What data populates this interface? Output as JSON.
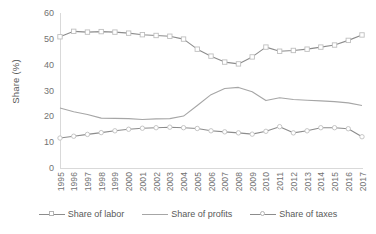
{
  "chart_data": {
    "type": "line",
    "title": "",
    "xlabel": "",
    "ylabel": "Share (%)",
    "ylim": [
      0,
      60
    ],
    "yticks": [
      0,
      10,
      20,
      30,
      40,
      50,
      60
    ],
    "grid": false,
    "legend_position": "bottom",
    "categories": [
      "1995",
      "1996",
      "1997",
      "1998",
      "1999",
      "2000",
      "2001",
      "2002",
      "2003",
      "2004",
      "2005",
      "2006",
      "2007",
      "2008",
      "2009",
      "2010",
      "2011",
      "2012",
      "2013",
      "2014",
      "2015",
      "2016",
      "2017"
    ],
    "series": [
      {
        "name": "Share of labor",
        "marker": "square",
        "color": "#8c8c8c",
        "values": [
          50.8,
          52.9,
          52.6,
          52.8,
          52.6,
          52.2,
          51.6,
          51.3,
          51.0,
          49.9,
          46.0,
          43.3,
          41.0,
          40.3,
          43.0,
          46.8,
          45.2,
          45.5,
          46.0,
          46.8,
          47.6,
          49.4,
          51.5
        ]
      },
      {
        "name": "Share of profits",
        "marker": "none",
        "color": "#a6a6a6",
        "values": [
          23.2,
          21.8,
          20.7,
          19.3,
          19.2,
          19.1,
          18.8,
          19.0,
          19.1,
          20.1,
          24.2,
          28.4,
          30.8,
          31.2,
          29.5,
          26.1,
          27.2,
          26.5,
          26.2,
          26.0,
          25.7,
          25.2,
          24.2
        ]
      },
      {
        "name": "Share of taxes",
        "marker": "circle",
        "color": "#8c8c8c",
        "values": [
          11.6,
          12.3,
          13.0,
          13.7,
          14.4,
          15.0,
          15.4,
          15.6,
          15.8,
          15.6,
          15.3,
          14.4,
          14.0,
          13.6,
          13.1,
          14.2,
          16.0,
          13.6,
          14.4,
          15.6,
          15.6,
          15.2,
          12.1
        ]
      }
    ]
  },
  "legend": {
    "items": [
      {
        "label": "Share of labor"
      },
      {
        "label": "Share of profits"
      },
      {
        "label": "Share of taxes"
      }
    ]
  }
}
